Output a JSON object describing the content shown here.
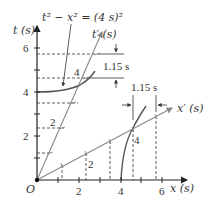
{
  "diagram": {
    "title_equation": "t² − x² = (4 s)²",
    "axes": {
      "x_label": "x (s)",
      "t_label": "t (s)",
      "x_prime_label": "x′ (s)",
      "t_prime_label": "t′ (s)",
      "origin_label": "O",
      "x_ticks": [
        "2",
        "4",
        "6"
      ],
      "t_ticks": [
        "2",
        "4",
        "6"
      ]
    },
    "primed_tick_labels": {
      "t_prime_2": "2",
      "t_prime_4": "4",
      "x_prime_2": "2",
      "x_prime_4": "4"
    },
    "dimension_labels": {
      "time_dilation": "1.15 s",
      "length_interval": "1.15 s"
    },
    "colors": {
      "axis": "#222222",
      "primed_axis": "#888888",
      "hyperbola": "#555555",
      "dashed": "#333333"
    }
  }
}
